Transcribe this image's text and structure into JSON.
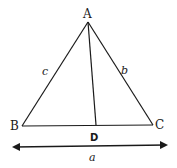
{
  "diagram": {
    "vertices": {
      "A": {
        "label": "A",
        "x": 88,
        "y": 22
      },
      "B": {
        "label": "B",
        "x": 22,
        "y": 126
      },
      "C": {
        "label": "C",
        "x": 153,
        "y": 125
      },
      "D": {
        "label": "D",
        "x": 96,
        "y": 125
      }
    },
    "sides": {
      "c": "c",
      "b": "b",
      "a": "a"
    },
    "stroke_color": "#1a1a1a"
  }
}
